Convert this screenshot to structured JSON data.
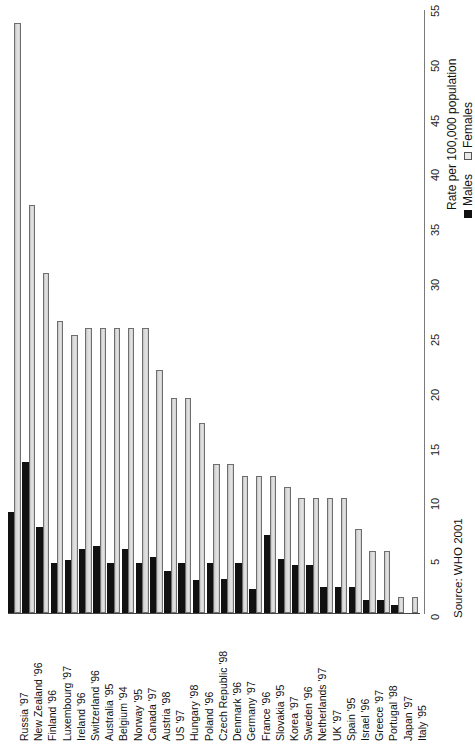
{
  "chart_data": {
    "type": "bar",
    "orientation": "vertical-bars-rotated",
    "title": "",
    "xlabel": "",
    "ylabel": "Rate per 100,000 population",
    "ylim": [
      0,
      55
    ],
    "ytick_step": 5,
    "grid": false,
    "legend_position": "right",
    "yticks": [
      "0",
      "5",
      "10",
      "15",
      "20",
      "25",
      "30",
      "35",
      "40",
      "45",
      "50",
      "55"
    ],
    "categories": [
      "Russia '97",
      "New Zealand '96",
      "Finland '96",
      "Luxembourg '97",
      "Ireland '96",
      "Switzerland '96",
      "Australia '95",
      "Belgium '94",
      "Norway '95",
      "Canada '97",
      "Austria '98",
      "US '97",
      "Hungary '98",
      "Poland '96",
      "Czech Republic '98",
      "Denmark '96",
      "Germany '97",
      "France '96",
      "Slovakia '95",
      "Korea '97",
      "Sweden '96",
      "Netherlands '97",
      "UK '97",
      "Spain '95",
      "Israel '96",
      "Greece '97",
      "Portugal '98",
      "Japan '97",
      "Italy '95"
    ],
    "series": [
      {
        "name": "Males",
        "color": "#111111",
        "values": [
          9.2,
          13.8,
          7.8,
          4.6,
          4.8,
          5.8,
          6.1,
          4.6,
          5.8,
          4.6,
          5.1,
          3.8,
          4.6,
          3.0,
          4.6,
          3.1,
          4.6,
          2.2,
          7.1,
          4.9,
          4.4,
          4.4,
          2.4,
          2.4,
          2.4,
          1.2,
          1.2,
          0.7,
          0.0
        ]
      },
      {
        "name": "Females",
        "color": "#dcdcdc",
        "values": [
          53.8,
          37.2,
          31.0,
          26.6,
          25.4,
          26.0,
          26.0,
          26.0,
          26.0,
          26.0,
          22.2,
          19.6,
          19.6,
          17.3,
          13.6,
          13.6,
          12.5,
          12.5,
          12.5,
          11.5,
          10.5,
          10.5,
          10.5,
          10.5,
          7.7,
          5.7,
          5.7,
          1.5,
          1.5
        ]
      }
    ]
  },
  "legend": {
    "males_label": "Males",
    "females_label": "Females"
  },
  "axis": {
    "value_axis_title": "Rate per 100,000 population"
  },
  "source": {
    "text": "Source: WHO 2001"
  }
}
